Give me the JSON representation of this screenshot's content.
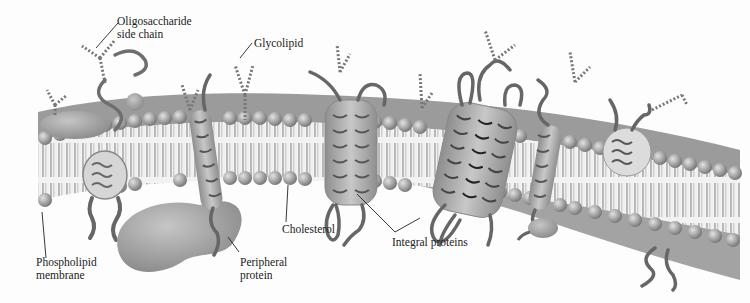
{
  "diagram": {
    "labels": {
      "oligosaccharide": {
        "line1": "Oligosaccharide",
        "line2": "side chain"
      },
      "glycolipid": "Glycolipid",
      "phospholipid": {
        "line1": "Phospholipid",
        "line2": "membrane"
      },
      "peripheral": {
        "line1": "Peripheral",
        "line2": "protein"
      },
      "cholesterol": "Cholesterol",
      "integral": "Integral proteins"
    },
    "colors": {
      "head": "#a9a9a9",
      "head_dark": "#7d7d7d",
      "tail": "#e6e6e6",
      "protein": "#9a9a9a",
      "chain": "#6f6f6f",
      "line": "#222222"
    }
  }
}
